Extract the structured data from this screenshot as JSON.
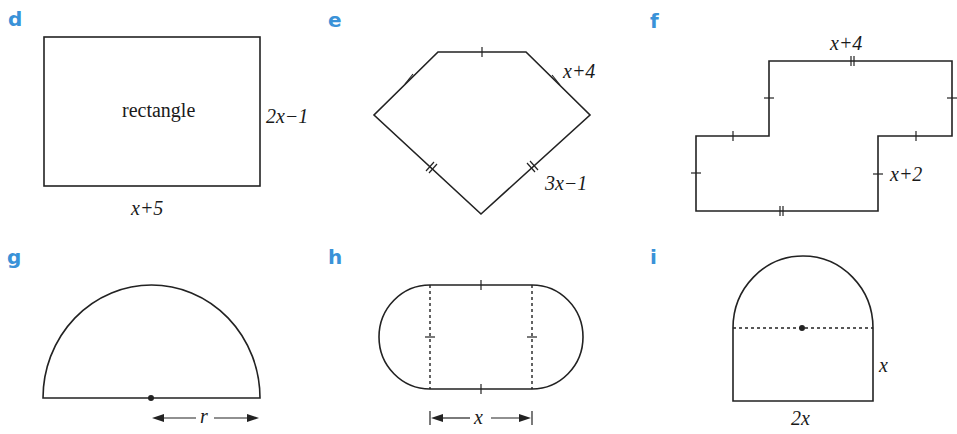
{
  "figures": [
    {
      "id": "d",
      "label": "d",
      "shape": "rectangle",
      "inner_text": "rectangle",
      "side_label": "2x−1",
      "bottom_label": "x+5"
    },
    {
      "id": "e",
      "label": "e",
      "shape": "pentagon",
      "top_right_label": "x+4",
      "bottom_right_label": "3x−1"
    },
    {
      "id": "f",
      "label": "f",
      "shape": "stepped-polygon",
      "top_label": "x+4",
      "right_label": "x+2"
    },
    {
      "id": "g",
      "label": "g",
      "shape": "semicircle",
      "radius_label": "r"
    },
    {
      "id": "h",
      "label": "h",
      "shape": "stadium",
      "width_label": "x"
    },
    {
      "id": "i",
      "label": "i",
      "shape": "rectangle-with-semicircle",
      "side_label": "x",
      "bottom_label": "2x"
    }
  ],
  "colors": {
    "label": "#3a92d8",
    "line": "#222222"
  }
}
